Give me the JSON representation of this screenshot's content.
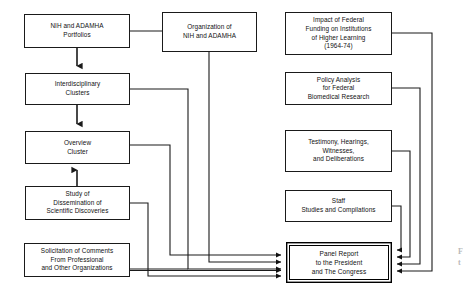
{
  "diagram": {
    "type": "flowchart",
    "background_color": "#ffffff",
    "line_color": "#1a1a1a",
    "nodes": [
      {
        "id": "nih-adamha-portfolios",
        "label": "NIH and ADAMHA\nPortfolios",
        "column": "left"
      },
      {
        "id": "organization-of-nih-and-adamha",
        "label": "Organization of\nNIH and ADAMHA",
        "column": "middle"
      },
      {
        "id": "interdisciplinary-clusters",
        "label": "Interdisciplinary\nClusters",
        "column": "left"
      },
      {
        "id": "overview-cluster",
        "label": "Overview\nCluster",
        "column": "left"
      },
      {
        "id": "study-of-dissemination",
        "label": "Study of\nDissemination of\nScientific Discoveries",
        "column": "left"
      },
      {
        "id": "solicitation-of-comments",
        "label": "Solicitation of Comments\nFrom Professional\nand Other Organizations",
        "column": "left"
      },
      {
        "id": "impact-of-federal-funding",
        "label": "Impact of Federal\nFunding on Institutions\nof Higher Learning\n(1964-74)",
        "column": "right"
      },
      {
        "id": "policy-analysis",
        "label": "Policy Analysis\nfor Federal\nBiomedical Research",
        "column": "right"
      },
      {
        "id": "testimony-hearings",
        "label": "Testimony, Hearings,\nWitnesses,\nand Deliberations",
        "column": "right"
      },
      {
        "id": "staff-studies",
        "label": "Staff\nStudies and Compilations",
        "column": "right"
      },
      {
        "id": "panel-report",
        "label": "Panel Report\nto the President\nand The Congress",
        "column": "bottom",
        "emphasis": true
      }
    ],
    "edge_caption": "F\nt"
  }
}
